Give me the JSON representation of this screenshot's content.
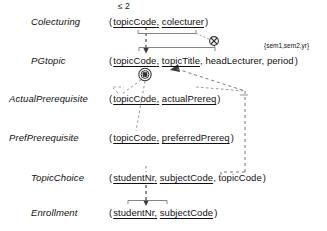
{
  "diagram": {
    "type": "relational-schema",
    "background": "#ffffff",
    "line_color": "#555555",
    "text_color": "#101010"
  },
  "relations": [
    {
      "name": "Colecturing",
      "open_paren": "(",
      "close_paren": ")",
      "attributes": [
        {
          "label": "topicCode",
          "key": true,
          "sep": ","
        },
        {
          "label": "colecturer",
          "key": true,
          "sep": ""
        }
      ]
    },
    {
      "name": "PGtopic",
      "open_paren": "(",
      "close_paren": ")",
      "attributes": [
        {
          "label": "topicCode",
          "key": true,
          "sep": ","
        },
        {
          "label": "topicTitle",
          "key": true,
          "sep": ","
        },
        {
          "label": "headLecturer",
          "key": false,
          "sep": ","
        },
        {
          "label": "period",
          "key": false,
          "sep": ""
        }
      ]
    },
    {
      "name": "ActualPrerequisite",
      "open_paren": "(",
      "close_paren": ")",
      "attributes": [
        {
          "label": "topicCode",
          "key": true,
          "sep": ","
        },
        {
          "label": "actualPrereq",
          "key": true,
          "sep": ""
        }
      ]
    },
    {
      "name": "PrefPrerequisite",
      "open_paren": "(",
      "close_paren": ")",
      "attributes": [
        {
          "label": "topicCode",
          "key": true,
          "sep": ","
        },
        {
          "label": "preferredPrereq",
          "key": true,
          "sep": ""
        }
      ]
    },
    {
      "name": "TopicChoice",
      "open_paren": "(",
      "close_paren": ")",
      "attributes": [
        {
          "label": "studentNr",
          "key": true,
          "sep": ","
        },
        {
          "label": "subjectCode",
          "key": true,
          "sep": ","
        },
        {
          "label": "topicCode",
          "key": false,
          "sep": ""
        }
      ]
    },
    {
      "name": "Enrollment",
      "open_paren": "(",
      "close_paren": ")",
      "attributes": [
        {
          "label": "studentNr",
          "key": true,
          "sep": ","
        },
        {
          "label": "subjectCode",
          "key": true,
          "sep": ""
        }
      ]
    }
  ],
  "annotations": {
    "cardinality_constraint": "≤ 2",
    "value_constraint": "{sem1,sem2,yr}",
    "exclusion_symbol": "⊗",
    "exclusive_or_symbol": "⊙"
  }
}
